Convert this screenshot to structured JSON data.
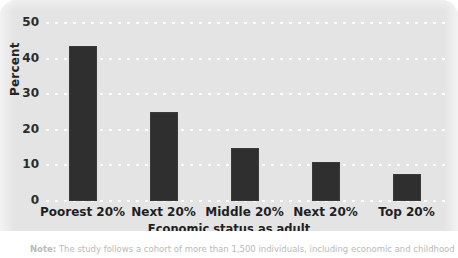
{
  "chart_data": {
    "type": "bar",
    "title": "",
    "xlabel": "Economic status as adult",
    "ylabel": "Percent",
    "categories": [
      "Poorest 20%",
      "Next 20%",
      "Middle 20%",
      "Next 20%",
      "Top 20%"
    ],
    "values": [
      43.5,
      25,
      15,
      11,
      7.5
    ],
    "yticks": [
      0,
      10,
      20,
      30,
      40,
      50
    ],
    "ytick_labels": [
      "0",
      "10",
      "20",
      "30",
      "40",
      "50"
    ],
    "ylim": [
      0,
      50
    ],
    "grid": "horizontal-dotted-white",
    "legend": "none",
    "bar_color": "#2f2f2f",
    "plot_background": "#e4e4e4"
  },
  "footnote": {
    "prefix": "Note:",
    "text": "The study follows a cohort of more than 1,500 individuals, including economic and childhood"
  }
}
